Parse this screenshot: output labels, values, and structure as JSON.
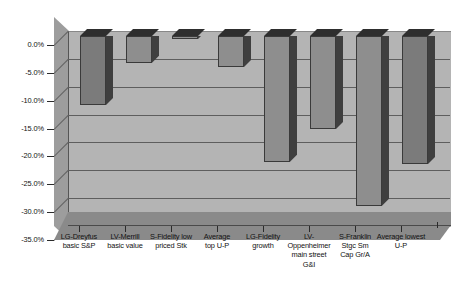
{
  "chart_data": {
    "type": "bar",
    "title": "",
    "subtitle": "",
    "xlabel": "",
    "ylabel": "",
    "ylim": [
      -35.0,
      0.0
    ],
    "grid": true,
    "legend": false,
    "legend_position": "none",
    "style": "3d-column",
    "value_format": "percent-one-decimal",
    "categories": [
      "LG-Dreyfus basic S&P",
      "LV-Merrill basic value",
      "S-Fidelity low priced Stk",
      "Average top U-P",
      "LG-Fidelity growth",
      "LV-Oppenheimer main street G&I",
      "S-Franklin Stgc Sm Cap Gr/A",
      "Average lowest U-P"
    ],
    "category_lines": [
      [
        "LG-Dreyfus",
        "basic S&P"
      ],
      [
        "LV-Merrill",
        "basic value"
      ],
      [
        "S-Fidelity low",
        "priced Stk"
      ],
      [
        "Average",
        "top U-P"
      ],
      [
        "LG-Fidelity",
        "growth"
      ],
      [
        "LV-",
        "Oppenheimer",
        "main street",
        "G&I"
      ],
      [
        "S-Franklin",
        "Stgc Sm",
        "Cap Gr/A"
      ],
      [
        "Average lowest",
        "U-P"
      ]
    ],
    "values": [
      -12.4,
      -4.8,
      -0.5,
      -5.6,
      -22.6,
      -16.7,
      -30.5,
      -23.0
    ],
    "ytick_labels": [
      "0.0%",
      "-5.0%",
      "-10.0%",
      "-15.0%",
      "-20.0%",
      "-25.0%",
      "-30.0%",
      "-35.0%"
    ],
    "ytick_values": [
      0.0,
      -5.0,
      -10.0,
      -15.0,
      -20.0,
      -25.0,
      -30.0,
      -35.0
    ],
    "colors": {
      "plot_background": "#b4b4b4",
      "wall": "#9d9d9d",
      "floor": "#8a8a8a",
      "bar_face": "#8e8e8e",
      "bar_face_dark": "#7b7b7b",
      "bar_side": "#4a4a4a",
      "bar_top": "#2e2e2e",
      "gridline": "#5e5e5e",
      "text": "#121212",
      "page_background": "#ffffff"
    }
  }
}
